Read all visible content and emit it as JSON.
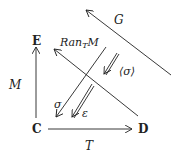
{
  "nodes": {
    "E": "E",
    "C": "C",
    "D": "D"
  },
  "labels": {
    "M": "M",
    "T": "T",
    "G": "G",
    "ran_base": "Ran",
    "ran_sub": "T",
    "ran_arg": "M",
    "sigma": "σ",
    "sigma_bracket": "⟨σ⟩",
    "epsilon": "ε"
  },
  "colors": {
    "stroke": "#222222",
    "background": "#ffffff"
  }
}
